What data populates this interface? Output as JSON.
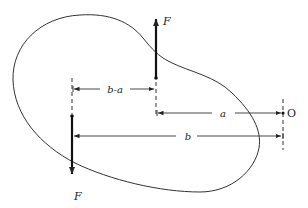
{
  "diagram": {
    "colors": {
      "stroke": "#222222",
      "background": "#ffffff"
    },
    "forces": [
      {
        "id": "force-up",
        "label": "F",
        "direction": "up"
      },
      {
        "id": "force-down",
        "label": "F",
        "direction": "down"
      }
    ],
    "dimensions": [
      {
        "id": "dim-b-minus-a",
        "label": "b-a"
      },
      {
        "id": "dim-a",
        "label": "a"
      },
      {
        "id": "dim-b",
        "label": "b"
      }
    ],
    "point": {
      "id": "point-o",
      "label": "O"
    }
  }
}
